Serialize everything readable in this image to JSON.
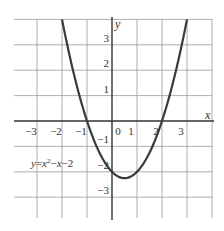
{
  "chart_data": {
    "type": "line",
    "title": "",
    "xlabel": "x",
    "ylabel": "y",
    "equation_label": "y=x²−x−2",
    "equation_parts": {
      "y": "y",
      "eq": "=",
      "x": "x",
      "sup": "2",
      "rest1": "−",
      "x2": "x",
      "rest2": "−2"
    },
    "xlim": [
      -3.9,
      4.0
    ],
    "ylim": [
      -3.8,
      4.0
    ],
    "grid": true,
    "x_ticks": [
      -3,
      -2,
      -1,
      0,
      1,
      2,
      3
    ],
    "x_tick_labels": [
      "−3",
      "−2",
      "−1",
      "0",
      "1",
      "2",
      "3"
    ],
    "y_ticks": [
      3,
      2,
      1,
      -1,
      -2,
      -3
    ],
    "y_tick_labels": [
      "3",
      "2",
      "1",
      "−1",
      "−2",
      "−3"
    ],
    "series": [
      {
        "name": "y=x²−x−2",
        "x": [
          -2.0,
          -1.5,
          -1.0,
          -0.5,
          0.0,
          0.5,
          1.0,
          1.5,
          2.0,
          2.5,
          3.0
        ],
        "y": [
          4.0,
          1.75,
          0.0,
          -1.25,
          -2.0,
          -2.25,
          -2.0,
          -1.25,
          0.0,
          1.75,
          4.0
        ]
      }
    ],
    "key_points": {
      "x_intercepts": [
        -1,
        2
      ],
      "y_intercept": -2,
      "vertex": [
        0.5,
        -2.25
      ]
    }
  }
}
